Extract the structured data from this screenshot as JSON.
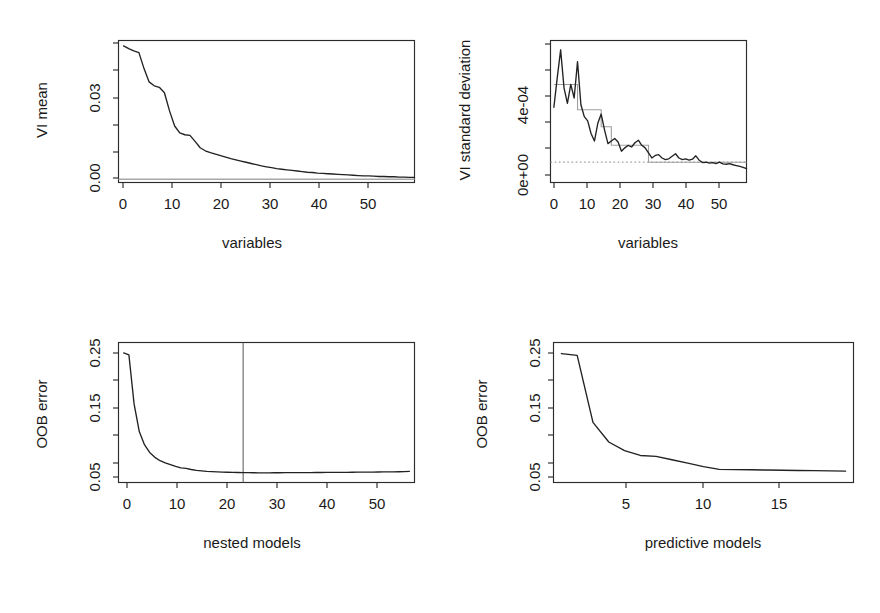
{
  "figure": {
    "background": "#ffffff",
    "width": 880,
    "height": 613,
    "layout": "2x2 grid of R base-graphics scatter/line panels"
  },
  "panels": [
    {
      "id": "vi-mean",
      "position": "top-left",
      "ylabel": "VI mean",
      "xlabel": "variables",
      "y_ticks": [
        "0.00",
        "0.03"
      ],
      "x_ticks": [
        "0",
        "10",
        "20",
        "30",
        "40",
        "50"
      ]
    },
    {
      "id": "vi-sd",
      "position": "top-right",
      "ylabel": "VI standard deviation",
      "xlabel": "variables",
      "y_ticks": [
        "0e+00",
        "4e-04"
      ],
      "x_ticks": [
        "0",
        "10",
        "20",
        "30",
        "40",
        "50"
      ]
    },
    {
      "id": "oob-nested",
      "position": "bottom-left",
      "ylabel": "OOB error",
      "xlabel": "nested models",
      "y_ticks": [
        "0.05",
        "0.15",
        "0.25"
      ],
      "x_ticks": [
        "0",
        "10",
        "20",
        "30",
        "40",
        "50"
      ]
    },
    {
      "id": "oob-predictive",
      "position": "bottom-right",
      "ylabel": "OOB error",
      "xlabel": "predictive models",
      "y_ticks": [
        "0.05",
        "0.15",
        "0.25"
      ],
      "x_ticks": [
        "5",
        "10",
        "15"
      ]
    }
  ],
  "chart_data": [
    {
      "type": "line",
      "id": "vi-mean",
      "title": "",
      "xlabel": "variables",
      "ylabel": "VI mean",
      "xlim": [
        0,
        58
      ],
      "ylim": [
        -0.0015,
        0.0455
      ],
      "xticks": [
        0,
        10,
        20,
        30,
        40,
        50
      ],
      "yticks": [
        0.0,
        0.03
      ],
      "ytick_labels": [
        "0.00",
        "0.03"
      ],
      "xtick_labels": [
        "0",
        "10",
        "20",
        "30",
        "40",
        "50"
      ],
      "grid": false,
      "legend": "none",
      "series": [
        {
          "name": "VI mean (sorted, decreasing)",
          "color": "#222222",
          "style": "solid",
          "x": [
            1,
            2,
            3,
            4,
            5,
            6,
            7,
            8,
            9,
            10,
            11,
            12,
            13,
            14,
            15,
            16,
            17,
            18,
            19,
            20,
            21,
            22,
            23,
            24,
            25,
            26,
            27,
            28,
            29,
            30,
            31,
            32,
            33,
            34,
            35,
            36,
            37,
            38,
            39,
            40,
            41,
            42,
            43,
            44,
            45,
            46,
            47,
            48,
            49,
            50,
            51,
            52,
            53,
            54,
            55,
            56,
            57,
            58
          ],
          "y": [
            0.0437,
            0.0428,
            0.0421,
            0.0415,
            0.0362,
            0.0318,
            0.0305,
            0.03,
            0.0282,
            0.0222,
            0.0172,
            0.0149,
            0.0143,
            0.0141,
            0.0121,
            0.01,
            0.009,
            0.0084,
            0.0079,
            0.0074,
            0.0069,
            0.0064,
            0.006,
            0.0056,
            0.0052,
            0.0048,
            0.0044,
            0.004,
            0.0037,
            0.0034,
            0.0031,
            0.0029,
            0.0027,
            0.0025,
            0.0023,
            0.0021,
            0.0019,
            0.0018,
            0.0016,
            0.0015,
            0.0014,
            0.0013,
            0.0012,
            0.0011,
            0.001,
            0.0009,
            0.0008,
            0.0007,
            0.0007,
            0.0006,
            0.0005,
            0.0005,
            0.0004,
            0.0004,
            0.0003,
            0.0003,
            0.0002,
            0.0002
          ]
        },
        {
          "name": "threshold (horizontal grey line)",
          "color": "#a8a8a8",
          "style": "solid-horizontal",
          "y_value": -0.0004
        }
      ]
    },
    {
      "type": "line",
      "id": "vi-sd",
      "title": "",
      "xlabel": "variables",
      "ylabel": "VI standard deviation",
      "xlim": [
        0,
        58
      ],
      "ylim": [
        -6e-05,
        0.00078
      ],
      "xticks": [
        0,
        10,
        20,
        30,
        40,
        50
      ],
      "yticks": [
        0.0,
        0.0004
      ],
      "ytick_labels": [
        "0e+00",
        "4e-04"
      ],
      "xtick_labels": [
        "0",
        "10",
        "20",
        "30",
        "40",
        "50"
      ],
      "grid": false,
      "legend": "none",
      "series": [
        {
          "name": "VI standard deviation",
          "color": "#222222",
          "style": "solid",
          "x": [
            1,
            2,
            3,
            4,
            5,
            6,
            7,
            8,
            9,
            10,
            11,
            12,
            13,
            14,
            15,
            16,
            17,
            18,
            19,
            20,
            21,
            22,
            23,
            24,
            25,
            26,
            27,
            28,
            29,
            30,
            31,
            32,
            33,
            34,
            35,
            36,
            37,
            38,
            39,
            40,
            41,
            42,
            43,
            44,
            45,
            46,
            47,
            48,
            49,
            50,
            51,
            52,
            53,
            54,
            55,
            56,
            57,
            58
          ],
          "y": [
            0.000385,
            0.00056,
            0.000725,
            0.0005,
            0.000408,
            0.00052,
            0.00044,
            0.000655,
            0.0004,
            0.00033,
            0.000305,
            0.00023,
            0.000185,
            0.00029,
            0.000345,
            0.00025,
            0.00017,
            0.000185,
            0.0002,
            0.00018,
            0.000125,
            0.000145,
            0.00016,
            0.00015,
            0.000175,
            0.00019,
            0.00016,
            0.000145,
            0.000115,
            8.5e-05,
            0.0001,
            0.000105,
            8.5e-05,
            7.5e-05,
            8e-05,
            9.5e-05,
            0.00011,
            8.5e-05,
            7.5e-05,
            8e-05,
            7.2e-05,
            7.8e-05,
            9.8e-05,
            7.2e-05,
            5.8e-05,
            6e-05,
            5.5e-05,
            5.8e-05,
            5.2e-05,
            6e-05,
            5e-05,
            4.8e-05,
            5.2e-05,
            4.5e-05,
            4e-05,
            3.5e-05,
            3e-05,
            2.2e-05
          ]
        },
        {
          "name": "CART step fit",
          "color": "#9e9e9e",
          "style": "step",
          "x_breaks": [
            1,
            8,
            15,
            18,
            29,
            58
          ],
          "levels": [
            0.00052,
            0.00037,
            0.00027,
            0.00016,
            6e-05
          ]
        },
        {
          "name": "minimum threshold (dotted)",
          "color": "#a0a0a0",
          "style": "dotted-horizontal",
          "y_value": 6e-05
        }
      ]
    },
    {
      "type": "line",
      "id": "oob-nested",
      "title": "",
      "xlabel": "nested models",
      "ylabel": "OOB error",
      "xlim": [
        0,
        57
      ],
      "ylim": [
        0.035,
        0.263
      ],
      "xticks": [
        0,
        10,
        20,
        30,
        40,
        50
      ],
      "yticks": [
        0.05,
        0.15,
        0.25
      ],
      "ytick_labels": [
        "0.05",
        "0.15",
        "0.25"
      ],
      "xtick_labels": [
        "0",
        "10",
        "20",
        "30",
        "40",
        "50"
      ],
      "grid": false,
      "legend": "none",
      "series": [
        {
          "name": "OOB error of nested models",
          "color": "#222222",
          "style": "solid",
          "x": [
            1,
            2,
            3,
            4,
            5,
            6,
            7,
            8,
            9,
            10,
            11,
            12,
            13,
            14,
            15,
            16,
            17,
            18,
            19,
            20,
            21,
            22,
            23,
            24,
            25,
            26,
            27,
            28,
            29,
            30,
            31,
            32,
            33,
            34,
            35,
            36,
            37,
            38,
            39,
            40,
            41,
            42,
            43,
            44,
            45,
            46,
            47,
            48,
            49,
            50,
            51,
            52,
            53,
            54,
            55,
            56
          ],
          "y": [
            0.246,
            0.243,
            0.163,
            0.118,
            0.0965,
            0.084,
            0.076,
            0.0705,
            0.067,
            0.064,
            0.0612,
            0.0588,
            0.058,
            0.0562,
            0.0548,
            0.054,
            0.0532,
            0.0527,
            0.0523,
            0.052,
            0.0517,
            0.0515,
            0.0513,
            0.0511,
            0.051,
            0.0509,
            0.0508,
            0.0508,
            0.0508,
            0.0509,
            0.0509,
            0.051,
            0.051,
            0.0511,
            0.0511,
            0.0512,
            0.0512,
            0.0513,
            0.0513,
            0.0514,
            0.0514,
            0.0515,
            0.0516,
            0.0516,
            0.0517,
            0.0518,
            0.0518,
            0.0519,
            0.052,
            0.0521,
            0.0522,
            0.0523,
            0.0524,
            0.0525,
            0.0527,
            0.053
          ]
        },
        {
          "name": "selected model size (vertical line)",
          "color": "#555555",
          "style": "vertical-line",
          "x_value": 24
        }
      ]
    },
    {
      "type": "line",
      "id": "oob-predictive",
      "title": "",
      "xlabel": "predictive models",
      "ylabel": "OOB error",
      "xlim": [
        0.5,
        19.5
      ],
      "ylim": [
        0.035,
        0.263
      ],
      "xticks": [
        5,
        10,
        15
      ],
      "yticks": [
        0.05,
        0.15,
        0.25
      ],
      "ytick_labels": [
        "0.05",
        "0.15",
        "0.25"
      ],
      "xtick_labels": [
        "5",
        "10",
        "15"
      ],
      "grid": false,
      "legend": "none",
      "series": [
        {
          "name": "OOB error of predictive models",
          "color": "#222222",
          "style": "solid",
          "x": [
            1,
            2,
            3,
            4,
            5,
            6,
            7,
            8,
            9,
            10,
            11,
            12,
            13,
            14,
            15,
            16,
            17,
            18,
            19
          ],
          "y": [
            0.245,
            0.242,
            0.133,
            0.101,
            0.087,
            0.079,
            0.0775,
            0.072,
            0.0665,
            0.061,
            0.0565,
            0.056,
            0.0557,
            0.0553,
            0.055,
            0.0546,
            0.0543,
            0.054,
            0.0535
          ]
        }
      ]
    }
  ]
}
